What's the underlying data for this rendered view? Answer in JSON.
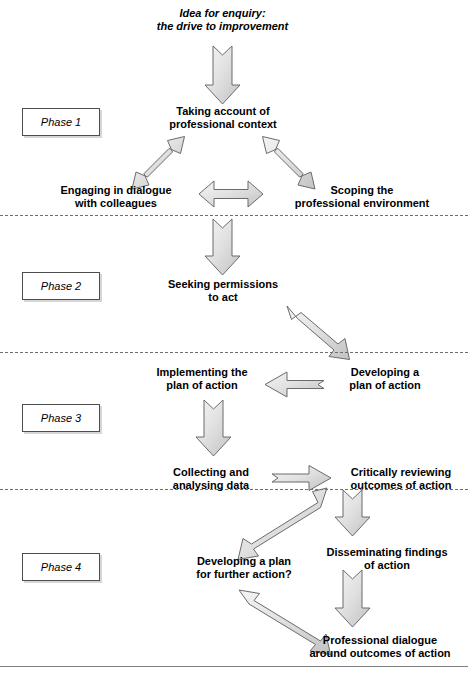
{
  "diagram": {
    "background_color": "#ffffff",
    "arrow_fill_light": "#efefef",
    "arrow_fill_dark": "#c9c9c9",
    "arrow_stroke": "#6b6b6b",
    "divider_color": "#6e6e6e",
    "baseline_color": "#808080"
  },
  "phases": [
    {
      "label": "Phase 1"
    },
    {
      "label": "Phase 2"
    },
    {
      "label": "Phase 3"
    },
    {
      "label": "Phase 4"
    }
  ],
  "nodes": {
    "idea": {
      "line1": "Idea for enquiry:",
      "line2": "the drive to improvement"
    },
    "taking_account": {
      "line1": "Taking account of",
      "line2": "professional context"
    },
    "engaging": {
      "line1": "Engaging in dialogue",
      "line2": "with colleagues"
    },
    "scoping": {
      "line1": "Scoping the",
      "line2": "professional environment"
    },
    "seeking": {
      "line1": "Seeking permissions",
      "line2": "to act"
    },
    "implementing": {
      "line1": "Implementing the",
      "line2": "plan of action"
    },
    "developing_plan": {
      "line1": "Developing a",
      "line2": "plan of action"
    },
    "collecting": {
      "line1": "Collecting and",
      "line2": "analysing data"
    },
    "reviewing": {
      "line1": "Critically reviewing",
      "line2": "outcomes of action"
    },
    "further_action": {
      "line1": "Developing a plan",
      "line2": "for further action?"
    },
    "disseminating": {
      "line1": "Disseminating findings",
      "line2": "of action"
    },
    "prof_dialogue": {
      "line1": "Professional dialogue",
      "line2": "around outcomes of action"
    }
  },
  "connectors": [
    {
      "name": "idea-to-taking-account",
      "direction": "down",
      "from": "idea",
      "to": "taking_account"
    },
    {
      "name": "taking-account-to-engaging",
      "direction": "double-diagonal-down-left",
      "from": "taking_account",
      "to": "engaging"
    },
    {
      "name": "taking-account-to-scoping",
      "direction": "double-diagonal-down-right",
      "from": "taking_account",
      "to": "scoping"
    },
    {
      "name": "engaging-to-scoping",
      "direction": "double-horizontal",
      "from": "engaging",
      "to": "scoping"
    },
    {
      "name": "phase1-to-seeking",
      "direction": "down",
      "from": "taking_account",
      "to": "seeking"
    },
    {
      "name": "seeking-to-developing-plan",
      "direction": "diagonal-down-right",
      "from": "seeking",
      "to": "developing_plan"
    },
    {
      "name": "developing-to-implementing",
      "direction": "left",
      "from": "developing_plan",
      "to": "implementing"
    },
    {
      "name": "implementing-to-collecting",
      "direction": "down",
      "from": "implementing",
      "to": "collecting"
    },
    {
      "name": "collecting-to-reviewing",
      "direction": "right",
      "from": "collecting",
      "to": "reviewing"
    },
    {
      "name": "reviewing-to-further-action",
      "direction": "diagonal-down-left",
      "from": "reviewing",
      "to": "further_action"
    },
    {
      "name": "reviewing-to-disseminating",
      "direction": "down",
      "from": "reviewing",
      "to": "disseminating"
    },
    {
      "name": "disseminating-to-prof-dialogue",
      "direction": "down",
      "from": "disseminating",
      "to": "prof_dialogue"
    },
    {
      "name": "prof-dialogue-to-further-action",
      "direction": "diagonal-up-left",
      "from": "prof_dialogue",
      "to": "further_action"
    }
  ]
}
